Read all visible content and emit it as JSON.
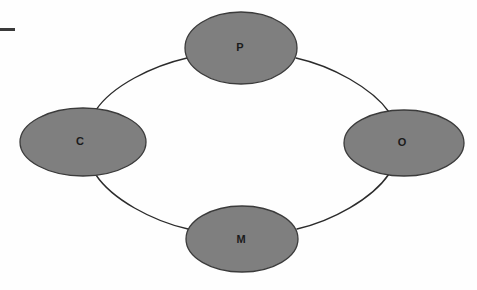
{
  "diagram": {
    "type": "cycle-diagram",
    "title": "",
    "background_color": "#fefefe",
    "node_fill_color": "#7f7f7f",
    "node_stroke_color": "#3b3b3b",
    "label_color": "#1b1b1b",
    "connector_color": "#2b2b2b",
    "nodes": [
      {
        "id": "p",
        "label": "P",
        "position": "top",
        "cx": 241,
        "cy": 48,
        "rx": 56,
        "ry": 36,
        "label_x": 240,
        "label_y": 48
      },
      {
        "id": "c",
        "label": "C",
        "position": "left",
        "cx": 83,
        "cy": 142,
        "rx": 63,
        "ry": 34,
        "label_x": 80,
        "label_y": 142
      },
      {
        "id": "o",
        "label": "O",
        "position": "right",
        "cx": 404,
        "cy": 143,
        "rx": 60,
        "ry": 33,
        "label_x": 402,
        "label_y": 143
      },
      {
        "id": "m",
        "label": "M",
        "position": "bottom",
        "cx": 242,
        "cy": 239,
        "rx": 56,
        "ry": 33,
        "label_x": 241,
        "label_y": 240
      }
    ],
    "connectors": [
      {
        "id": "c-to-p",
        "from": "c",
        "to": "p",
        "path": "M 96 110 C 112 86, 152 66, 187 58"
      },
      {
        "id": "p-to-o",
        "from": "p",
        "to": "o",
        "path": "M 296 58 C 332 66, 372 88, 389 112"
      },
      {
        "id": "o-to-m",
        "from": "o",
        "to": "m",
        "path": "M 389 174 C 372 199, 332 221, 297 229"
      },
      {
        "id": "m-to-c",
        "from": "m",
        "to": "c",
        "path": "M 188 229 C 152 221, 112 199, 96 175"
      }
    ],
    "marks": [
      {
        "id": "corner-dash",
        "x": 0,
        "y": 28,
        "width": 15,
        "height": 3,
        "color": "#3a3a3a"
      }
    ]
  }
}
